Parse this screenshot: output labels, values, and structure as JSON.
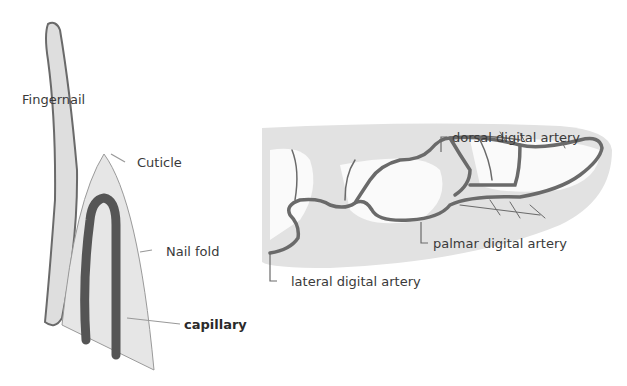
{
  "left_diagram": {
    "labels": {
      "fingernail": "Fingernail",
      "cuticle": "Cuticle",
      "nail_fold": "Nail fold",
      "capillary": "capillary"
    }
  },
  "right_diagram": {
    "labels": {
      "dorsal": "dorsal digital artery",
      "palmar": "palmar digital artery",
      "lateral": "lateral digital artery"
    }
  },
  "colors": {
    "fill_light": "#e4e4e4",
    "vessel": "#6a6a6a",
    "capillary": "#555555",
    "outline": "#808080"
  }
}
